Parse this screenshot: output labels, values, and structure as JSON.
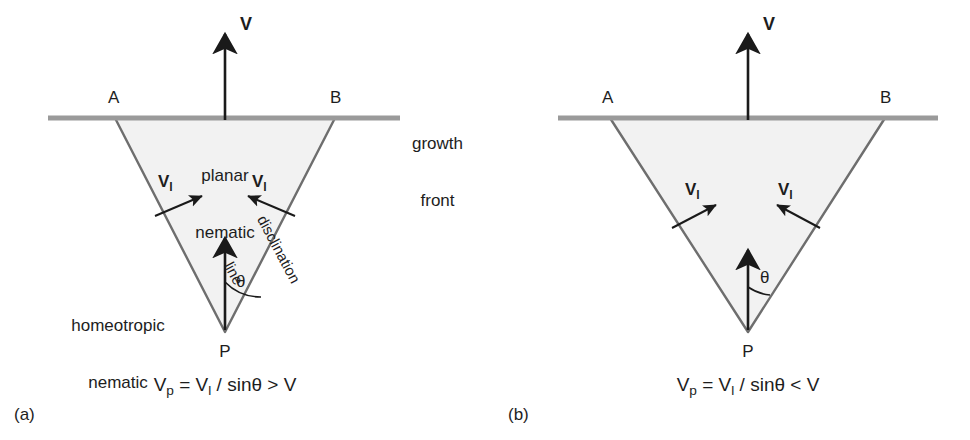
{
  "figure": {
    "colors": {
      "growth_front_line": "#9a9a9a",
      "triangle_fill": "#f2f2f2",
      "triangle_edge": "#6e6e6e",
      "arrow": "#1a1a1a",
      "text": "#1d1d1d",
      "background": "#ffffff"
    }
  },
  "panels": [
    {
      "id": "a",
      "caption": "(a)",
      "vertex_a_label": "A",
      "vertex_b_label": "B",
      "apex_label": "P",
      "velocity_label": "V",
      "line_velocity_left_label": "V",
      "line_velocity_left_sub": "l",
      "line_velocity_right_label": "V",
      "line_velocity_right_sub": "l",
      "angle_label": "θ",
      "region_upper_line1": "planar",
      "region_upper_line2": "nematic",
      "region_lower_line1": "homeotropic",
      "region_lower_line2": "nematic",
      "disclination_line1": "disclination",
      "disclination_line2": "line",
      "formula": {
        "lhs": "V",
        "lhs_sub": "p",
        "equals": " = ",
        "numerator": "V",
        "numerator_sub": "l",
        "divider": " / sin",
        "angle": "θ",
        "comparison": " > ",
        "rhs": "V",
        "plain": "Vp = Vl / sinθ > V"
      },
      "geometry": {
        "apex_x": 225,
        "apex_y": 332,
        "vertex_a_x": 115,
        "vertex_b_x": 335,
        "front_y": 118,
        "half_angle_deg": 18
      }
    },
    {
      "id": "b",
      "caption": "(b)",
      "vertex_a_label": "A",
      "vertex_b_label": "B",
      "apex_label": "P",
      "velocity_label": "V",
      "line_velocity_left_label": "V",
      "line_velocity_left_sub": "l",
      "line_velocity_right_label": "V",
      "line_velocity_right_sub": "l",
      "angle_label": "θ",
      "formula": {
        "lhs": "V",
        "lhs_sub": "p",
        "equals": " = ",
        "numerator": "V",
        "numerator_sub": "l",
        "divider": " / sin",
        "angle": "θ",
        "comparison": " < ",
        "rhs": "V",
        "plain": "Vp = Vl / sinθ < V"
      },
      "geometry": {
        "apex_x": 748,
        "apex_y": 332,
        "vertex_a_x": 610,
        "vertex_b_x": 885,
        "front_y": 118,
        "half_angle_deg": 28
      }
    }
  ],
  "shared": {
    "growth_front_line1": "growth",
    "growth_front_line2": "front"
  }
}
